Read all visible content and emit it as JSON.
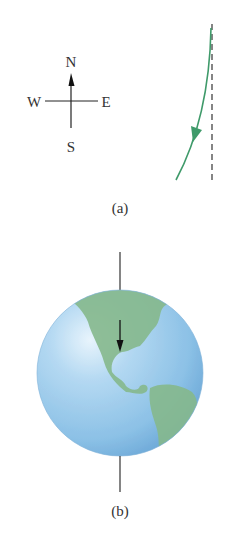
{
  "panel_a": {
    "label": "(a)",
    "compass": {
      "north": "N",
      "south": "S",
      "west": "W",
      "east": "E"
    },
    "colors": {
      "path": "#3f9a6a",
      "reference_line": "#444444",
      "compass": "#222222"
    }
  },
  "panel_b": {
    "label": "(b)",
    "colors": {
      "ocean": "#8ec2e6",
      "land": "#86b98c",
      "axis": "#333333",
      "arrow": "#111111"
    }
  }
}
